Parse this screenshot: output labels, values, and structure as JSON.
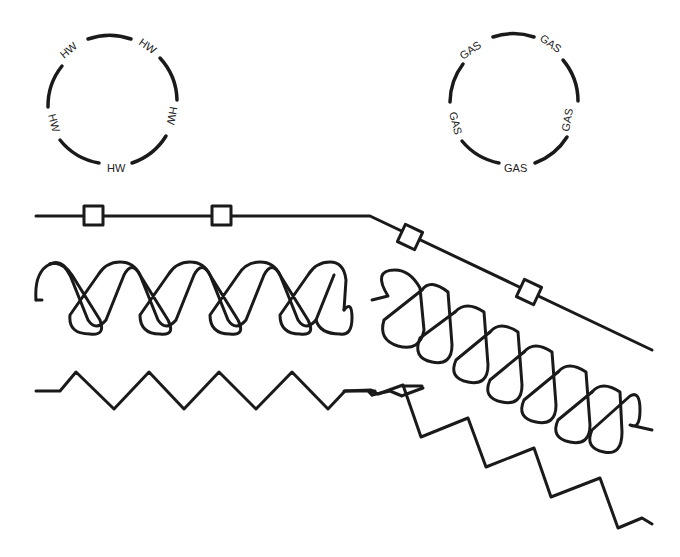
{
  "diagram": {
    "circles": [
      {
        "name": "hot-water-pipe-symbol",
        "label": "HW",
        "labels": [
          "HW",
          "HW",
          "HW",
          "HW",
          "HW"
        ]
      },
      {
        "name": "gas-pipe-symbol",
        "label": "GAS",
        "labels": [
          "GAS",
          "GAS",
          "GAS",
          "GAS",
          "GAS"
        ]
      }
    ],
    "lines": [
      {
        "name": "pipe-with-square-markers",
        "markers": 4
      },
      {
        "name": "batt-insulation-loop",
        "loops_straight": 9,
        "loops_angled": 7
      },
      {
        "name": "zigzag-insulation",
        "peaks": 4
      }
    ],
    "colors": {
      "stroke": "#1a1a1a",
      "background": "#ffffff"
    }
  }
}
